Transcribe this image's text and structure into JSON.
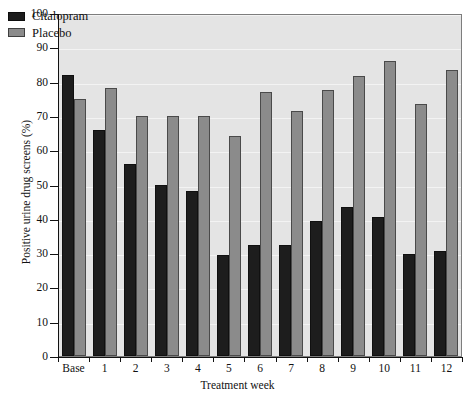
{
  "chart_data": {
    "type": "bar",
    "title": "",
    "subtitle": "",
    "xlabel": "Treatment week",
    "ylabel": "Positive urine drug screens (%)",
    "categories": [
      "Base",
      "1",
      "2",
      "3",
      "4",
      "5",
      "6",
      "7",
      "8",
      "9",
      "10",
      "11",
      "12"
    ],
    "series": [
      {
        "name": "Citalopram",
        "color": "#1d1d1d",
        "values": [
          82,
          66,
          56,
          50,
          48,
          29.5,
          32.5,
          32.5,
          39.5,
          43.5,
          40.5,
          29.8,
          30.6
        ]
      },
      {
        "name": "Placebo",
        "color": "#8b8b8b",
        "values": [
          75,
          78,
          70,
          70,
          70,
          64,
          77,
          71.5,
          77.5,
          81.5,
          86,
          73.5,
          83.5
        ]
      }
    ],
    "ylim": [
      0,
      100
    ],
    "yticks": [
      0,
      10,
      20,
      30,
      40,
      50,
      60,
      70,
      80,
      90,
      100
    ],
    "ytick_labels": [
      "0",
      "10",
      "20",
      "30",
      "40",
      "50",
      "60",
      "70",
      "80",
      "90",
      "100"
    ],
    "grid": true,
    "legend_position": "top-left",
    "plot_background": "#e4e4e4",
    "frame_color": "#7d7d7d"
  }
}
